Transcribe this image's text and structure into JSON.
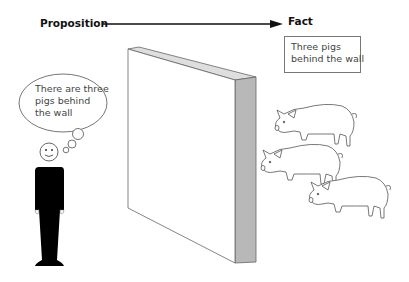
{
  "diagram": {
    "arrow": {
      "from_label": "Proposition",
      "to_label": "Fact"
    },
    "fact_box": {
      "lines": [
        "Three  pigs",
        "behind the wall"
      ]
    },
    "thought_bubble": {
      "lines": [
        "There are three",
        "pigs behind",
        "the wall"
      ]
    },
    "elements": {
      "person": "standing person thinking",
      "wall": "3D wall",
      "pigs": 3
    },
    "colors": {
      "line": "#555555",
      "wall_top": "#dcdcdc",
      "wall_side": "#b5b5b5",
      "person": "#000000"
    }
  }
}
